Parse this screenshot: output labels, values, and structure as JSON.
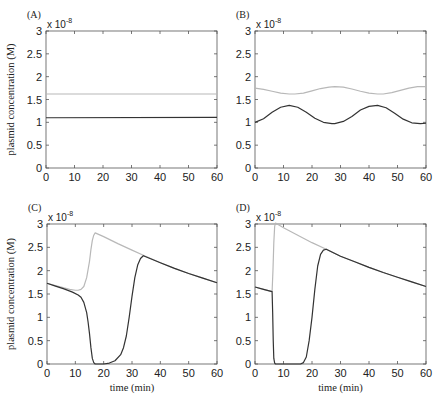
{
  "chart_data": [
    {
      "panel": "(A)",
      "type": "line",
      "exponent_label": "x 10",
      "exponent": "-8",
      "ylabel": "plasmid concentration (M)",
      "xlabel": "",
      "xlim": [
        0,
        60
      ],
      "ylim": [
        0,
        3
      ],
      "xticks": [
        0,
        10,
        20,
        30,
        40,
        50,
        60
      ],
      "yticks": [
        "0",
        "0.5",
        "1",
        "1.5",
        "2",
        "2.5",
        "3"
      ],
      "grid": false,
      "series": [
        {
          "name": "gray",
          "color": "#b8b8b8",
          "x": [
            0,
            60
          ],
          "y": [
            1.62,
            1.62
          ]
        },
        {
          "name": "black",
          "color": "#333333",
          "x": [
            0,
            60
          ],
          "y": [
            1.1,
            1.11
          ]
        }
      ]
    },
    {
      "panel": "(B)",
      "type": "line",
      "exponent_label": "x 10",
      "exponent": "-8",
      "ylabel": "",
      "xlabel": "",
      "xlim": [
        0,
        60
      ],
      "ylim": [
        0,
        3
      ],
      "xticks": [
        0,
        10,
        20,
        30,
        40,
        50,
        60
      ],
      "yticks": [
        "0",
        "0.5",
        "1",
        "1.5",
        "2",
        "2.5",
        "3"
      ],
      "grid": false,
      "series": [
        {
          "name": "gray",
          "color": "#b8b8b8",
          "x": [
            0,
            3,
            6,
            9,
            12,
            14,
            17,
            20,
            23,
            26,
            28,
            31,
            34,
            37,
            40,
            43,
            45,
            48,
            51,
            54,
            57,
            60
          ],
          "y": [
            1.75,
            1.72,
            1.68,
            1.64,
            1.62,
            1.62,
            1.64,
            1.69,
            1.74,
            1.77,
            1.78,
            1.77,
            1.73,
            1.68,
            1.64,
            1.62,
            1.62,
            1.65,
            1.7,
            1.75,
            1.78,
            1.78
          ]
        },
        {
          "name": "black",
          "color": "#333333",
          "x": [
            0,
            3,
            6,
            9,
            12,
            15,
            18,
            21,
            24,
            27,
            28,
            31,
            34,
            37,
            40,
            43,
            46,
            49,
            52,
            55,
            58,
            60
          ],
          "y": [
            1.0,
            1.08,
            1.22,
            1.33,
            1.37,
            1.33,
            1.22,
            1.09,
            1.0,
            0.97,
            0.97,
            1.02,
            1.13,
            1.27,
            1.35,
            1.37,
            1.32,
            1.2,
            1.07,
            0.99,
            0.97,
            0.98
          ]
        }
      ]
    },
    {
      "panel": "(C)",
      "type": "line",
      "exponent_label": "x 10",
      "exponent": "-8",
      "ylabel": "plasmid concentration (M)",
      "xlabel": "time (min)",
      "xlim": [
        0,
        60
      ],
      "ylim": [
        0,
        3
      ],
      "xticks": [
        0,
        10,
        20,
        30,
        40,
        50,
        60
      ],
      "yticks": [
        "0",
        "0.5",
        "1",
        "1.5",
        "2",
        "2.5",
        "3"
      ],
      "grid": false,
      "series": [
        {
          "name": "gray",
          "color": "#b8b8b8",
          "x": [
            0,
            3,
            6,
            8,
            10,
            11,
            12,
            13,
            14,
            15,
            15.5,
            16,
            16.5,
            17,
            20,
            25,
            30,
            34,
            40,
            45,
            50,
            55,
            60
          ],
          "y": [
            1.73,
            1.68,
            1.63,
            1.6,
            1.58,
            1.58,
            1.6,
            1.66,
            1.85,
            2.2,
            2.45,
            2.65,
            2.76,
            2.81,
            2.73,
            2.58,
            2.44,
            2.33,
            2.17,
            2.05,
            1.94,
            1.84,
            1.74
          ]
        },
        {
          "name": "black",
          "color": "#333333",
          "x": [
            0,
            3,
            6,
            9,
            11,
            12,
            13,
            14,
            14.5,
            15,
            15.5,
            16,
            16.5,
            17,
            18,
            20,
            22,
            24,
            26,
            27,
            28,
            29,
            30,
            31,
            32,
            33,
            34,
            40,
            45,
            50,
            55,
            60
          ],
          "y": [
            1.73,
            1.67,
            1.61,
            1.54,
            1.48,
            1.43,
            1.32,
            1.1,
            0.9,
            0.65,
            0.35,
            0.12,
            0.03,
            0.0,
            0.0,
            0.0,
            0.02,
            0.07,
            0.2,
            0.35,
            0.6,
            1.0,
            1.45,
            1.85,
            2.12,
            2.26,
            2.32,
            2.17,
            2.05,
            1.94,
            1.84,
            1.74
          ]
        }
      ]
    },
    {
      "panel": "(D)",
      "type": "line",
      "exponent_label": "x 10",
      "exponent": "-8",
      "ylabel": "",
      "xlabel": "time (min)",
      "xlim": [
        0,
        60
      ],
      "ylim": [
        0,
        3
      ],
      "xticks": [
        0,
        10,
        20,
        30,
        40,
        50,
        60
      ],
      "yticks": [
        "0",
        "0.5",
        "1",
        "1.5",
        "2",
        "2.5",
        "3"
      ],
      "grid": false,
      "series": [
        {
          "name": "gray",
          "color": "#b8b8b8",
          "x": [
            0,
            3,
            6,
            6.3,
            6.6,
            6.9,
            7.2,
            10,
            15,
            20,
            25,
            30,
            35,
            40,
            45,
            50,
            55,
            60
          ],
          "y": [
            1.65,
            1.6,
            1.55,
            2.0,
            2.6,
            2.95,
            3.02,
            2.92,
            2.76,
            2.6,
            2.46,
            2.31,
            2.19,
            2.07,
            1.96,
            1.86,
            1.76,
            1.66
          ]
        },
        {
          "name": "black",
          "color": "#333333",
          "x": [
            0,
            3,
            6,
            6.2,
            6.4,
            6.6,
            6.9,
            7.2,
            10,
            14,
            16,
            17,
            18,
            19,
            20,
            21,
            22,
            23,
            24,
            25,
            30,
            35,
            40,
            45,
            50,
            55,
            60
          ],
          "y": [
            1.65,
            1.6,
            1.55,
            1.1,
            0.5,
            0.12,
            0.02,
            0.0,
            0.0,
            0.0,
            0.0,
            0.03,
            0.15,
            0.5,
            1.0,
            1.6,
            2.1,
            2.35,
            2.44,
            2.46,
            2.31,
            2.19,
            2.07,
            1.96,
            1.86,
            1.76,
            1.66
          ]
        }
      ]
    }
  ]
}
